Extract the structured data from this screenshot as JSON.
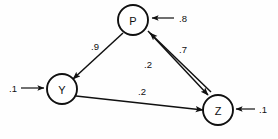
{
  "figure": {
    "type": "path-diagram",
    "background_color": "#fefefe",
    "stroke_color": "#101010",
    "width": 278,
    "height": 139
  },
  "nodes": [
    {
      "id": "P",
      "label": "P",
      "cx": 133,
      "cy": 20,
      "r": 15
    },
    {
      "id": "Y",
      "label": "Y",
      "cx": 62,
      "cy": 89,
      "r": 15
    },
    {
      "id": "Z",
      "label": "Z",
      "cx": 218,
      "cy": 110,
      "r": 15
    }
  ],
  "edges": [
    {
      "id": "p-to-y",
      "from": "P",
      "to": "Y",
      "weight": ".9",
      "label_x": 95,
      "label_y": 46,
      "arrow": "single"
    },
    {
      "id": "p-to-z",
      "from": "P",
      "to": "Z",
      "weight": ".7",
      "label_x": 183,
      "label_y": 49,
      "arrow": "single"
    },
    {
      "id": "z-to-p",
      "from": "Z",
      "to": "P",
      "weight": ".2",
      "label_x": 148,
      "label_y": 64,
      "arrow": "single"
    },
    {
      "id": "y-to-z",
      "from": "Y",
      "to": "Z",
      "weight": ".2",
      "label_x": 142,
      "label_y": 91,
      "arrow": "single"
    }
  ],
  "exogenous_inputs": [
    {
      "id": "exo-p",
      "target": "P",
      "weight": ".8",
      "label_x": 183,
      "label_y": 18,
      "line_from_x": 174,
      "line_from_y": 18,
      "line_to_x": 152,
      "line_to_y": 18
    },
    {
      "id": "exo-y",
      "target": "Y",
      "weight": ".1",
      "label_x": 13,
      "label_y": 88,
      "line_from_x": 21,
      "line_from_y": 88,
      "line_to_x": 44,
      "line_to_y": 88
    },
    {
      "id": "exo-z",
      "target": "Z",
      "weight": ".1",
      "label_x": 263,
      "label_y": 109,
      "line_from_x": 255,
      "line_from_y": 109,
      "line_to_x": 236,
      "line_to_y": 109
    }
  ]
}
